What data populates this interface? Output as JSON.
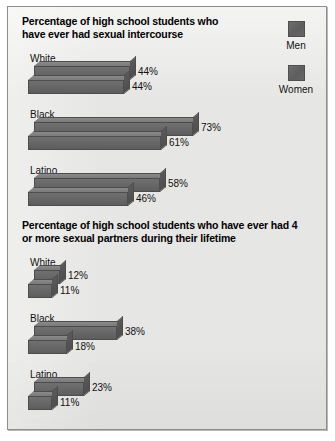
{
  "legend": {
    "items": [
      {
        "label": "Men",
        "color": "#636363"
      },
      {
        "label": "Women",
        "color": "#636363"
      }
    ]
  },
  "panels": [
    {
      "title": "Percentage of high school students who have ever had sexual intercourse",
      "groups": [
        {
          "label": "White",
          "men": "44%",
          "women": "44%"
        },
        {
          "label": "Black",
          "men": "73%",
          "women": "61%"
        },
        {
          "label": "Latino",
          "men": "58%",
          "women": "46%"
        }
      ]
    },
    {
      "title": "Percentage of high school students who have ever had 4 or more sexual partners during their lifetime",
      "groups": [
        {
          "label": "White",
          "men": "12%",
          "women": "11%"
        },
        {
          "label": "Black",
          "men": "38%",
          "women": "18%"
        },
        {
          "label": "Latino",
          "men": "23%",
          "women": "11%"
        }
      ]
    }
  ],
  "chart_data": {
    "type": "bar",
    "orientation": "horizontal",
    "grid": false,
    "legend_position": "top-right",
    "legend": [
      "Men",
      "Women"
    ],
    "xlabel": "",
    "ylabel": "",
    "xlim": [
      0,
      100
    ],
    "units": "percent",
    "charts": [
      {
        "title": "Percentage of high school students who have ever had sexual intercourse",
        "categories": [
          "White",
          "Black",
          "Latino"
        ],
        "series": [
          {
            "name": "Men",
            "values": [
              44,
              73,
              58
            ]
          },
          {
            "name": "Women",
            "values": [
              44,
              61,
              46
            ]
          }
        ],
        "data_labels": [
          [
            "44%",
            "44%"
          ],
          [
            "73%",
            "61%"
          ],
          [
            "58%",
            "46%"
          ]
        ]
      },
      {
        "title": "Percentage of high school students who have ever had 4 or more sexual partners during their lifetime",
        "categories": [
          "White",
          "Black",
          "Latino"
        ],
        "series": [
          {
            "name": "Men",
            "values": [
              12,
              38,
              23
            ]
          },
          {
            "name": "Women",
            "values": [
              11,
              18,
              11
            ]
          }
        ],
        "data_labels": [
          [
            "12%",
            "11%"
          ],
          [
            "38%",
            "18%"
          ],
          [
            "23%",
            "11%"
          ]
        ]
      }
    ]
  },
  "scale": {
    "px_per_percent": 2.18
  }
}
